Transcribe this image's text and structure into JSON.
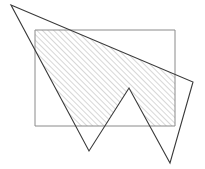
{
  "figure": {
    "canvas": {
      "width": 205,
      "height": 169,
      "background": "#ffffff"
    },
    "shapes": {
      "rectangle": {
        "name": "axis-aligned rectangle",
        "x": 35,
        "y": 30,
        "width": 140,
        "height": 96,
        "points": "35,30 175,30 175,126 35,126",
        "stroke_color": "#8a8a8a",
        "stroke_width": 1,
        "fill": "none"
      },
      "polygon": {
        "name": "concave zigzag polygon",
        "vertex_count": 6,
        "points": "11,5 193,82 170,163 129,88 89,151 11,5",
        "vertices": [
          {
            "label": "top-left-apex",
            "x": 11,
            "y": 5
          },
          {
            "label": "right-vertex",
            "x": 193,
            "y": 82
          },
          {
            "label": "lower-right-spike-tip",
            "x": 170,
            "y": 163
          },
          {
            "label": "middle-peak",
            "x": 129,
            "y": 88
          },
          {
            "label": "lower-left-spike-tip",
            "x": 89,
            "y": 151
          }
        ],
        "stroke_color": "#3a3a3a",
        "stroke_width": 1.1,
        "fill": "none"
      },
      "hatched_region": {
        "name": "intersection of polygon and rectangle",
        "description": "region inside both the rectangle and the polygon, filled with diagonal hatching",
        "fill_pattern": "diagonal-hatch",
        "hatch_color": "#9b9b9b",
        "hatch_spacing": 4,
        "hatch_angle_degrees": 45,
        "hatch_line_width": 0.8
      }
    }
  }
}
